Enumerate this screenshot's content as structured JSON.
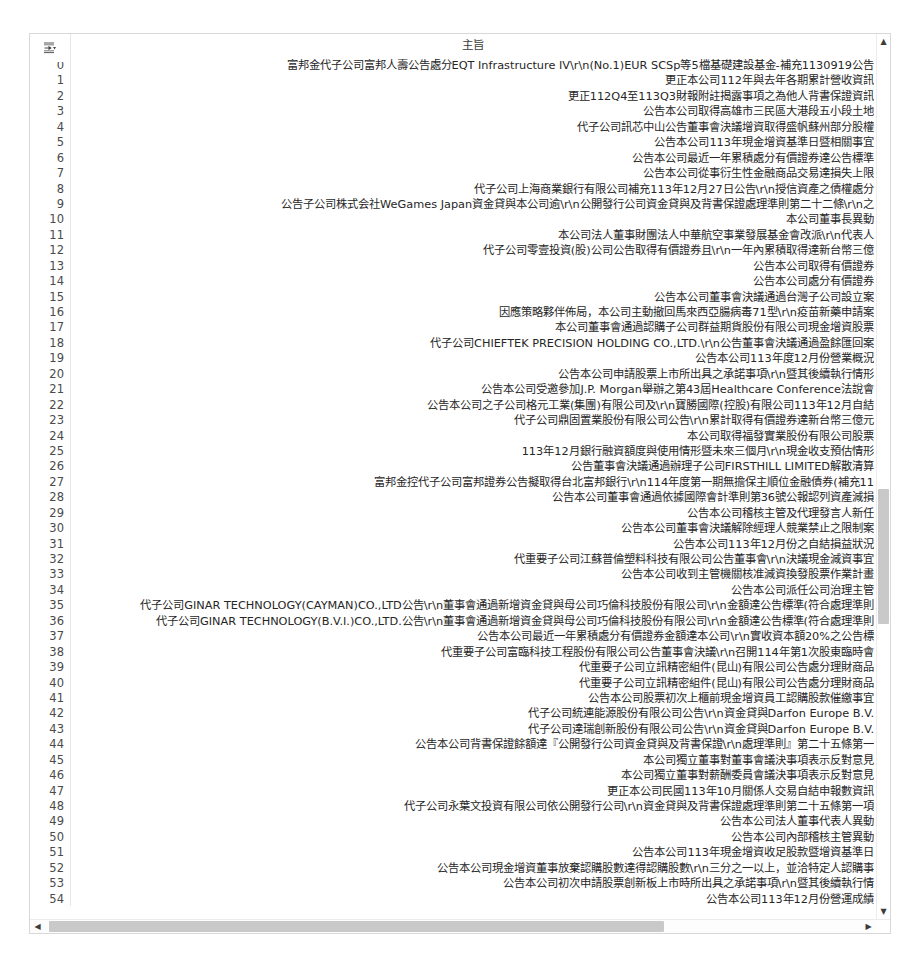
{
  "table": {
    "column_header": "主旨",
    "index_label": "",
    "corner_icon": "expand-index-icon",
    "rows": [
      {
        "index": "0",
        "subject": "富邦金代子公司富邦人壽公告處分EQT Infrastructure IV\\r\\n(No.1)EUR SCSp等5檔基礎建設基金-補充1130919公告"
      },
      {
        "index": "1",
        "subject": "更正本公司112年與去年各期累計營收資訊"
      },
      {
        "index": "2",
        "subject": "更正112Q4至113Q3財報附註揭露事項之為他人背書保證資訊"
      },
      {
        "index": "3",
        "subject": "公告本公司取得高雄市三民區大港段五小段土地"
      },
      {
        "index": "4",
        "subject": "代子公司訊芯中山公告董事會決議增資取得盛帆蘇州部分股權"
      },
      {
        "index": "5",
        "subject": "公告本公司113年現金增資基準日暨相關事宜"
      },
      {
        "index": "6",
        "subject": "公告本公司最近一年累積處分有價證券達公告標準"
      },
      {
        "index": "7",
        "subject": "公告本公司從事衍生性金融商品交易達損失上限"
      },
      {
        "index": "8",
        "subject": "代子公司上海商業銀行有限公司補充113年12月27日公告\\r\\n授信資產之債權處分"
      },
      {
        "index": "9",
        "subject": "公告子公司株式会社WeGames Japan資金貸與本公司逾\\r\\n公開發行公司資金貸與及背書保證處理準則第二十二條\\r\\n之"
      },
      {
        "index": "10",
        "subject": "本公司董事長異動"
      },
      {
        "index": "11",
        "subject": "本公司法人董事財團法人中華航空事業發展基金會改派\\r\\n代表人"
      },
      {
        "index": "12",
        "subject": "代子公司零壹投資(股)公司公告取得有價證券且\\r\\n一年內累積取得達新台幣三億"
      },
      {
        "index": "13",
        "subject": "公告本公司取得有價證券"
      },
      {
        "index": "14",
        "subject": "公告本公司處分有價證券"
      },
      {
        "index": "15",
        "subject": "公告本公司董事會決議通過台灣子公司設立案"
      },
      {
        "index": "16",
        "subject": "因應策略夥伴佈局，本公司主動撤回馬來西亞腸病毒71型\\r\\n疫苗新藥申請案"
      },
      {
        "index": "17",
        "subject": "本公司董事會通過認購子公司群益期貨股份有限公司現金增資股票"
      },
      {
        "index": "18",
        "subject": "代子公司CHIEFTEK PRECISION HOLDING CO.,LTD.\\r\\n公告董事會決議通過盈餘匯回案"
      },
      {
        "index": "19",
        "subject": "公告本公司113年度12月份營業概況"
      },
      {
        "index": "20",
        "subject": "公告本公司申請股票上市所出具之承諾事項\\r\\n暨其後續執行情形"
      },
      {
        "index": "21",
        "subject": "公告本公司受邀參加J.P. Morgan舉辦之第43屆Healthcare Conference法說會"
      },
      {
        "index": "22",
        "subject": "公告本公司之子公司格元工業(集團)有限公司及\\r\\n寶勝國際(控股)有限公司113年12月自結"
      },
      {
        "index": "23",
        "subject": "代子公司鼎固置業股份有限公司公告\\r\\n累計取得有價證券達新台幣三億元"
      },
      {
        "index": "24",
        "subject": "本公司取得福發實業股份有限公司股票"
      },
      {
        "index": "25",
        "subject": "113年12月銀行融資額度與使用情形暨未來三個月\\r\\n現金收支預估情形"
      },
      {
        "index": "26",
        "subject": "公告董事會決議通過辦理子公司FIRSTHILL LIMITED解散清算"
      },
      {
        "index": "27",
        "subject": "富邦金控代子公司富邦證券公告擬取得台北富邦銀行\\r\\n114年度第一期無擔保主順位金融債券(補充11"
      },
      {
        "index": "28",
        "subject": "公告本公司董事會通過依據國際會計準則第36號公報認列資產減損"
      },
      {
        "index": "29",
        "subject": "公告本公司稽核主管及代理發言人新任"
      },
      {
        "index": "30",
        "subject": "公告本公司董事會決議解除經理人競業禁止之限制案"
      },
      {
        "index": "31",
        "subject": "公告本公司113年12月份之自結損益狀況"
      },
      {
        "index": "32",
        "subject": "代重要子公司江蘇普倫塑料科技有限公司公告董事會\\r\\n決議現金減資事宜"
      },
      {
        "index": "33",
        "subject": "公告本公司收到主管機關核准減資換發股票作業計畫"
      },
      {
        "index": "34",
        "subject": "公告本公司派任公司治理主管"
      },
      {
        "index": "35",
        "subject": "代子公司GINAR TECHNOLOGY(CAYMAN)CO.,LTD公告\\r\\n董事會通過新增資金貸與母公司巧倫科技股份有限公司\\r\\n金額達公告標準(符合處理準則"
      },
      {
        "index": "36",
        "subject": "代子公司GINAR TECHNOLOGY(B.V.I.)CO.,LTD.公告\\r\\n董事會通過新增資金貸與母公司巧倫科技股份有限公司\\r\\n金額達公告標準(符合處理準則"
      },
      {
        "index": "37",
        "subject": "公告本公司最近一年累積處分有價證券金額達本公司\\r\\n實收資本額20%之公告標"
      },
      {
        "index": "38",
        "subject": "代重要子公司富臨科技工程股份有限公司公告董事會決議\\r\\n召開114年第1次股東臨時會"
      },
      {
        "index": "39",
        "subject": "代重要子公司立訊精密組件(昆山)有限公司公告處分理財商品"
      },
      {
        "index": "40",
        "subject": "代重要子公司立訊精密組件(昆山)有限公司公告處分理財商品"
      },
      {
        "index": "41",
        "subject": "公告本公司股票初次上櫃前現金增資員工認購股款催繳事宜"
      },
      {
        "index": "42",
        "subject": "代子公司統連能源股份有限公司公告\\r\\n資金貸與Darfon Europe B.V."
      },
      {
        "index": "43",
        "subject": "代子公司達瑞創新股份有限公司公告\\r\\n資金貸與Darfon Europe B.V."
      },
      {
        "index": "44",
        "subject": "公告本公司背書保證餘額達『公開發行公司資金貸與及背書保證\\r\\n處理準則』第二十五條第一"
      },
      {
        "index": "45",
        "subject": "本公司獨立董事對董事會議決事項表示反對意見"
      },
      {
        "index": "46",
        "subject": "本公司獨立董事對薪酬委員會議決事項表示反對意見"
      },
      {
        "index": "47",
        "subject": "更正本公司民國113年10月關係人交易自結申報數資訊"
      },
      {
        "index": "48",
        "subject": "代子公司永葉文投資有限公司依公開發行公司\\r\\n資金貸與及背書保證處理準則第二十五條第一項"
      },
      {
        "index": "49",
        "subject": "公告本公司法人董事代表人異動"
      },
      {
        "index": "50",
        "subject": "公告本公司內部稽核主管異動"
      },
      {
        "index": "51",
        "subject": "公告本公司113年現金增資收足股款暨增資基準日"
      },
      {
        "index": "52",
        "subject": "公告本公司現金增資董事放棄認購股數達得認購股數\\r\\n三分之一以上，並洽特定人認購事"
      },
      {
        "index": "53",
        "subject": "公告本公司初次申請股票創新板上市時所出具之承諾事項\\r\\n暨其後續執行情"
      },
      {
        "index": "54",
        "subject": "公告本公司113年12月份營運成績"
      }
    ]
  },
  "scrollbars": {
    "vertical": {
      "up_arrow": "▲",
      "down_arrow": "▼"
    },
    "horizontal": {
      "left_arrow": "◀",
      "right_arrow": "▶"
    }
  }
}
